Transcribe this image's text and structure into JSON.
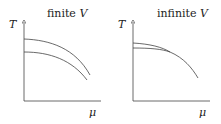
{
  "panels": [
    {
      "title": "finite",
      "title_var": "V",
      "y_label": "T",
      "x_label": "μ"
    },
    {
      "title": "infinite",
      "title_var": "V",
      "y_label": "T",
      "x_label": "μ"
    }
  ],
  "colors": {
    "line": "#444444"
  }
}
